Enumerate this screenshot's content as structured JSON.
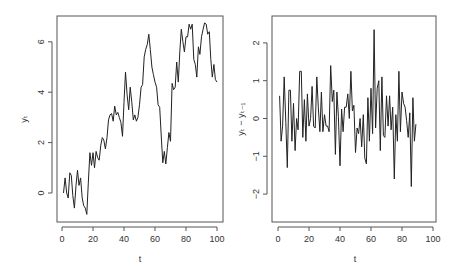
{
  "chart_data": [
    {
      "type": "line",
      "title": "",
      "xlabel": "t",
      "ylabel": "y_t",
      "ylabel_display": "yₜ",
      "xlim": [
        0,
        100
      ],
      "ylim": [
        -1.0,
        7.0
      ],
      "xticks": [
        0,
        20,
        40,
        60,
        80,
        100
      ],
      "yticks": [
        0,
        2,
        4,
        6
      ],
      "grid": false,
      "legend": null,
      "x": [
        1,
        2,
        3,
        4,
        5,
        6,
        7,
        8,
        9,
        10,
        11,
        12,
        13,
        14,
        15,
        16,
        17,
        18,
        19,
        20,
        21,
        22,
        23,
        24,
        25,
        26,
        27,
        28,
        29,
        30,
        31,
        32,
        33,
        34,
        35,
        36,
        37,
        38,
        39,
        40,
        41,
        42,
        43,
        44,
        45,
        46,
        47,
        48,
        49,
        50,
        51,
        52,
        53,
        54,
        55,
        56,
        57,
        58,
        59,
        60,
        61,
        62,
        63,
        64,
        65,
        66,
        67,
        68,
        69,
        70,
        71,
        72,
        73,
        74,
        75,
        76,
        77,
        78,
        79,
        80,
        81,
        82,
        83,
        84,
        85,
        86,
        87,
        88,
        89,
        90,
        91,
        92,
        93,
        94,
        95,
        96,
        97,
        98,
        99,
        100
      ],
      "values": [
        0.0,
        0.6,
        0.0,
        -0.2,
        0.8,
        0.7,
        -0.1,
        -0.6,
        0.3,
        0.9,
        0.3,
        0.6,
        -0.2,
        -0.5,
        -0.6,
        -0.85,
        0.4,
        1.6,
        1.1,
        1.6,
        1.0,
        1.65,
        1.4,
        1.3,
        1.9,
        2.2,
        2.1,
        1.75,
        2.2,
        2.9,
        3.1,
        3.15,
        2.85,
        3.45,
        3.1,
        3.2,
        3.0,
        2.8,
        2.25,
        3.6,
        4.8,
        3.9,
        3.3,
        4.2,
        3.6,
        2.9,
        3.1,
        2.85,
        3.0,
        3.5,
        4.2,
        4.3,
        5.4,
        5.7,
        5.9,
        6.3,
        5.7,
        5.0,
        4.7,
        4.4,
        4.2,
        3.5,
        3.4,
        2.3,
        1.2,
        1.65,
        1.15,
        1.8,
        2.4,
        2.05,
        4.35,
        4.1,
        4.2,
        5.2,
        4.4,
        5.6,
        6.5,
        6.0,
        5.6,
        6.2,
        6.2,
        6.7,
        6.5,
        6.7,
        5.3,
        5.1,
        4.6,
        5.8,
        5.5,
        6.2,
        6.5,
        6.75,
        6.7,
        6.3,
        6.4,
        5.3,
        4.6,
        5.1,
        4.5,
        4.4
      ]
    },
    {
      "type": "line",
      "title": "",
      "xlabel": "t",
      "ylabel": "y_t - y_{t-1}",
      "ylabel_display": "yₜ − yₜ₋₁",
      "xlim": [
        0,
        100
      ],
      "ylim": [
        -2.5,
        2.5
      ],
      "xticks": [
        0,
        20,
        40,
        60,
        80,
        100
      ],
      "yticks": [
        -2,
        -1,
        0,
        1,
        2
      ],
      "grid": false,
      "legend": null,
      "x": [
        1,
        2,
        3,
        4,
        5,
        6,
        7,
        8,
        9,
        10,
        11,
        12,
        13,
        14,
        15,
        16,
        17,
        18,
        19,
        20,
        21,
        22,
        23,
        24,
        25,
        26,
        27,
        28,
        29,
        30,
        31,
        32,
        33,
        34,
        35,
        36,
        37,
        38,
        39,
        40,
        41,
        42,
        43,
        44,
        45,
        46,
        47,
        48,
        49,
        50,
        51,
        52,
        53,
        54,
        55,
        56,
        57,
        58,
        59,
        60,
        61,
        62,
        63,
        64,
        65,
        66,
        67,
        68,
        69,
        70,
        71,
        72,
        73,
        74,
        75,
        76,
        77,
        78,
        79,
        80,
        81,
        82,
        83,
        84,
        85,
        86,
        87,
        88,
        89,
        90,
        91,
        92,
        93,
        94,
        95,
        96,
        97,
        98,
        99
      ],
      "values": [
        0.6,
        -0.6,
        -0.2,
        1.1,
        -0.1,
        -1.3,
        0.75,
        0.75,
        -0.6,
        0.4,
        -0.85,
        0.0,
        -0.3,
        1.25,
        1.25,
        -0.5,
        0.5,
        -0.6,
        0.65,
        -0.2,
        0.0,
        0.85,
        -0.2,
        -0.25,
        1.1,
        0.3,
        -0.35,
        0.7,
        -0.35,
        0.1,
        -0.2,
        -0.2,
        -0.35,
        1.4,
        0.45,
        0.75,
        -0.95,
        0.7,
        0.05,
        -1.25,
        0.25,
        -0.35,
        0.3,
        0.3,
        0.65,
        0.0,
        1.25,
        0.2,
        0.35,
        -0.9,
        -0.25,
        -0.4,
        0.0,
        -0.75,
        0.1,
        -1.05,
        -1.2,
        0.55,
        -0.6,
        0.8,
        -0.4,
        2.35,
        -0.25,
        0.8,
        1.0,
        -0.85,
        1.1,
        -0.45,
        -0.5,
        0.6,
        -0.2,
        0.6,
        -0.3,
        0.3,
        -1.6,
        0.1,
        -0.6,
        1.25,
        -0.35,
        0.7,
        0.4,
        0.3,
        -0.05,
        -0.5,
        0.15,
        -1.8,
        0.55,
        -0.6,
        -0.15
      ]
    }
  ]
}
